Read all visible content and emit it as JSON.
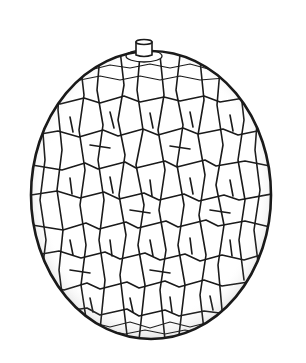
{
  "illustration": {
    "subject": "netted melon line drawing",
    "colors": {
      "background": "#ffffff",
      "ink": "#1a1a1a"
    },
    "parts": [
      "stem",
      "rind-netting",
      "outline"
    ]
  }
}
